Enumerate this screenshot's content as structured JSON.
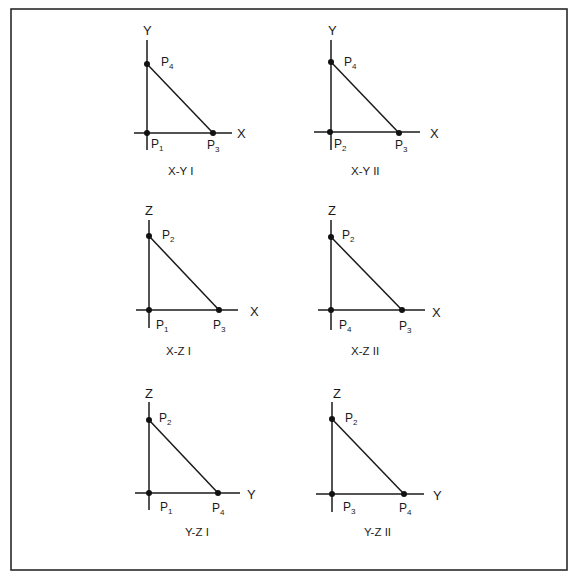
{
  "figure": {
    "frame_color": "#2a2a2a",
    "line_color": "#1a1a1a"
  },
  "panels": [
    {
      "id": "xy1",
      "caption": "X-Y I",
      "vertical_axis": "Y",
      "horizontal_axis": "X",
      "origin_point": {
        "base": "P",
        "sub": "1"
      },
      "top_point": {
        "base": "P",
        "sub": "4"
      },
      "right_point": {
        "base": "P",
        "sub": "3"
      }
    },
    {
      "id": "xy2",
      "caption": "X-Y II",
      "vertical_axis": "Y",
      "horizontal_axis": "X",
      "origin_point": {
        "base": "P",
        "sub": "2"
      },
      "top_point": {
        "base": "P",
        "sub": "4"
      },
      "right_point": {
        "base": "P",
        "sub": "3"
      }
    },
    {
      "id": "xz1",
      "caption": "X-Z I",
      "vertical_axis": "Z",
      "horizontal_axis": "X",
      "origin_point": {
        "base": "P",
        "sub": "1"
      },
      "top_point": {
        "base": "P",
        "sub": "2"
      },
      "right_point": {
        "base": "P",
        "sub": "3"
      }
    },
    {
      "id": "xz2",
      "caption": "X-Z II",
      "vertical_axis": "Z",
      "horizontal_axis": "X",
      "origin_point": {
        "base": "P",
        "sub": "4"
      },
      "top_point": {
        "base": "P",
        "sub": "2"
      },
      "right_point": {
        "base": "P",
        "sub": "3"
      }
    },
    {
      "id": "yz1",
      "caption": "Y-Z I",
      "vertical_axis": "Z",
      "horizontal_axis": "Y",
      "origin_point": {
        "base": "P",
        "sub": "1"
      },
      "top_point": {
        "base": "P",
        "sub": "2"
      },
      "right_point": {
        "base": "P",
        "sub": "4"
      }
    },
    {
      "id": "yz2",
      "caption": "Y-Z II",
      "vertical_axis": "Z",
      "horizontal_axis": "Y",
      "origin_point": {
        "base": "P",
        "sub": "3"
      },
      "top_point": {
        "base": "P",
        "sub": "2"
      },
      "right_point": {
        "base": "P",
        "sub": "4"
      }
    }
  ]
}
